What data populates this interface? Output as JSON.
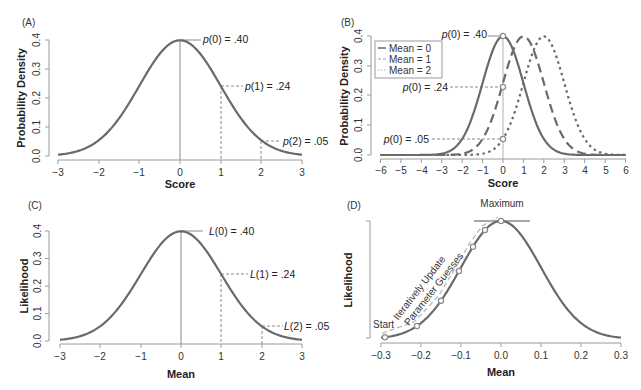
{
  "chart_data": [
    {
      "panel": "(A)",
      "type": "line",
      "title": "",
      "xlabel": "Score",
      "ylabel": "Probability Density",
      "xlim": [
        -3,
        3
      ],
      "ylim": [
        0,
        0.4
      ],
      "xticks": [
        "-3",
        "-2",
        "-1",
        "0",
        "1",
        "2",
        "3"
      ],
      "yticks": [
        "0.0",
        "0.1",
        "0.2",
        "0.3",
        "0.4"
      ],
      "series": [
        {
          "name": "Normal(0,1) density",
          "mean": 0,
          "sd": 1
        }
      ],
      "annotations": [
        {
          "x": 0,
          "y": 0.4,
          "text": "p(0) = .40"
        },
        {
          "x": 1,
          "y": 0.24,
          "text": "p(1) = .24"
        },
        {
          "x": 2,
          "y": 0.05,
          "text": "p(2) = .05"
        }
      ],
      "grid": false
    },
    {
      "panel": "(B)",
      "type": "line",
      "xlabel": "Score",
      "ylabel": "Probability Density",
      "xlim": [
        -6,
        6
      ],
      "ylim": [
        0,
        0.4
      ],
      "xticks": [
        "-6",
        "-5",
        "-4",
        "-3",
        "-2",
        "-1",
        "0",
        "1",
        "2",
        "3",
        "4",
        "5",
        "6"
      ],
      "yticks": [
        "0.0",
        "0.1",
        "0.2",
        "0.3",
        "0.4"
      ],
      "series": [
        {
          "name": "Mean = 0",
          "mean": 0,
          "sd": 1,
          "style": "solid"
        },
        {
          "name": "Mean = 1",
          "mean": 1,
          "sd": 1,
          "style": "dashed"
        },
        {
          "name": "Mean = 2",
          "mean": 2,
          "sd": 1,
          "style": "dotted"
        }
      ],
      "annotations": [
        {
          "x": 0,
          "y": 0.4,
          "text": "p(0) = .40"
        },
        {
          "x": 0,
          "y": 0.24,
          "text": "p(0) = .24"
        },
        {
          "x": 0,
          "y": 0.05,
          "text": "p(0) = .05"
        }
      ],
      "legend_position": "upper-left",
      "grid": false
    },
    {
      "panel": "(C)",
      "type": "line",
      "xlabel": "Mean",
      "ylabel": "Likelihood",
      "xlim": [
        -3,
        3
      ],
      "ylim": [
        0,
        0.4
      ],
      "xticks": [
        "-3",
        "-2",
        "-1",
        "0",
        "1",
        "2",
        "3"
      ],
      "yticks": [
        "0.0",
        "0.1",
        "0.2",
        "0.3",
        "0.4"
      ],
      "series": [
        {
          "name": "Likelihood",
          "mean": 0,
          "sd": 1
        }
      ],
      "annotations": [
        {
          "x": 0,
          "y": 0.4,
          "text": "L(0) = .40"
        },
        {
          "x": 1,
          "y": 0.24,
          "text": "L(1) = .24"
        },
        {
          "x": 2,
          "y": 0.05,
          "text": "L(2) = .05"
        }
      ],
      "grid": false
    },
    {
      "panel": "(D)",
      "type": "line",
      "xlabel": "Mean",
      "ylabel": "Likelihood",
      "xlim": [
        -0.3,
        0.3
      ],
      "xticks": [
        "-0.3",
        "-0.2",
        "-0.1",
        "0.0",
        "0.1",
        "0.2",
        "0.3"
      ],
      "yticks": [],
      "series": [
        {
          "name": "Likelihood",
          "mean": 0,
          "sd": 0.1
        }
      ],
      "iteration_points_x": [
        -0.29,
        -0.21,
        -0.15,
        -0.105,
        -0.07,
        -0.04,
        0.0
      ],
      "annotations": [
        {
          "text": "Maximum",
          "x": 0.0
        },
        {
          "text": "Start",
          "x": -0.29
        },
        {
          "text": "Iteratively Update",
          "rotated": true
        },
        {
          "text": "Parameter Guesses",
          "rotated": true
        }
      ],
      "grid": false
    }
  ],
  "panels": {
    "a": {
      "label": "(A)",
      "xlabel": "Score",
      "ylabel": "Probability Density",
      "xticks": [
        "−3",
        "−2",
        "−1",
        "0",
        "1",
        "2",
        "3"
      ],
      "yticks": [
        "0.0",
        "0.1",
        "0.2",
        "0.3",
        "0.4"
      ],
      "anno0_fn": "p",
      "anno0_rest": "(0) = .40",
      "anno1_fn": "p",
      "anno1_rest": "(1) = .24",
      "anno2_fn": "p",
      "anno2_rest": "(2) = .05"
    },
    "b": {
      "label": "(B)",
      "xlabel": "Score",
      "ylabel": "Probability Density",
      "xticks": [
        "−6",
        "−5",
        "−4",
        "−3",
        "−2",
        "−1",
        "0",
        "1",
        "2",
        "3",
        "4",
        "5",
        "6"
      ],
      "yticks": [
        "0.0",
        "0.1",
        "0.2",
        "0.3",
        "0.4"
      ],
      "legend": [
        "Mean = 0",
        "Mean = 1",
        "Mean = 2"
      ],
      "anno0_fn": "p",
      "anno0_rest": "(0) = .40",
      "anno1_fn": "p",
      "anno1_rest": "(0) = .24",
      "anno2_fn": "p",
      "anno2_rest": "(0) = .05"
    },
    "c": {
      "label": "(C)",
      "xlabel": "Mean",
      "ylabel": "Likelihood",
      "xticks": [
        "−3",
        "−2",
        "−1",
        "0",
        "1",
        "2",
        "3"
      ],
      "yticks": [
        "0.0",
        "0.1",
        "0.2",
        "0.3",
        "0.4"
      ],
      "anno0_fn": "L",
      "anno0_rest": "(0) = .40",
      "anno1_fn": "L",
      "anno1_rest": "(1) = .24",
      "anno2_fn": "L",
      "anno2_rest": "(2) = .05"
    },
    "d": {
      "label": "(D)",
      "xlabel": "Mean",
      "ylabel": "Likelihood",
      "xticks": [
        "−0.3",
        "−0.2",
        "−0.1",
        "0.0",
        "0.1",
        "0.2",
        "0.3"
      ],
      "maximum": "Maximum",
      "start": "Start",
      "arrow_line1": "Iteratively Update",
      "arrow_line2": "Parameter Guesses"
    }
  },
  "colors": {
    "curve": "#6a6a6a",
    "axis": "#9a9a9a",
    "text": "#222222",
    "background": "#ffffff"
  }
}
